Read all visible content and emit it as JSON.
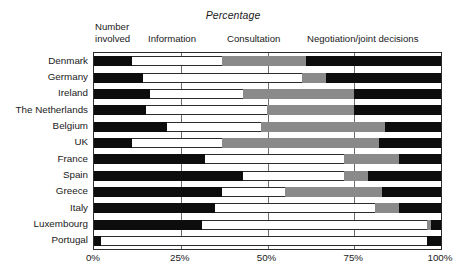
{
  "chart_data": {
    "type": "bar",
    "orientation": "horizontal",
    "stacked": true,
    "stack_mode": "percent",
    "title": "Percentage",
    "xlabel": "",
    "ylabel": "",
    "xlim": [
      0,
      100
    ],
    "grid": true,
    "gridlines": [
      25,
      50,
      75
    ],
    "legend_position": "top-inline",
    "tick_labels": [
      "0%",
      "25%",
      "50%",
      "75%",
      "100%"
    ],
    "tick_values": [
      0,
      25,
      50,
      75,
      100
    ],
    "segment_headers": [
      {
        "label_line1": "Number",
        "label_line2": "involved",
        "x": 95
      },
      {
        "label_line1": "Information",
        "label_line2": "",
        "x": 148
      },
      {
        "label_line1": "Consultation",
        "label_line2": "",
        "x": 227
      },
      {
        "label_line1": "Negotiation/joint decisions",
        "label_line2": "",
        "x": 307
      }
    ],
    "series": [
      {
        "name": "Number involved",
        "color": "#0d0d0d",
        "values": [
          11,
          14,
          16,
          15,
          21,
          11,
          32,
          43,
          37,
          35,
          31,
          2
        ]
      },
      {
        "name": "Information",
        "color": "#ffffff",
        "values": [
          26,
          46,
          27,
          35,
          27,
          26,
          40,
          29,
          18,
          46,
          65,
          94
        ]
      },
      {
        "name": "Consultation",
        "color": "#8a8a8a",
        "values": [
          24,
          7,
          32,
          25,
          36,
          45,
          16,
          7,
          28,
          7,
          1,
          0
        ]
      },
      {
        "name": "Negotiation/joint decisions",
        "color": "#0d0d0d",
        "values": [
          39,
          33,
          25,
          25,
          16,
          18,
          12,
          21,
          17,
          12,
          3,
          4
        ]
      }
    ],
    "categories": [
      "Denmark",
      "Germany",
      "Ireland",
      "The Netherlands",
      "Belgium",
      "UK",
      "France",
      "Spain",
      "Greece",
      "Italy",
      "Luxembourg",
      "Portugal"
    ]
  }
}
